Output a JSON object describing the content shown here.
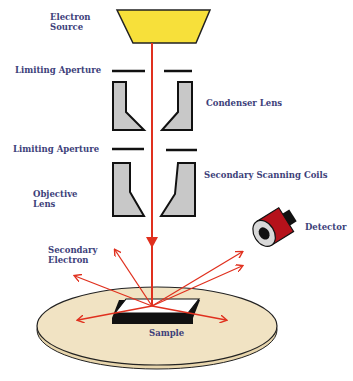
{
  "labels": {
    "electron_source_line1": "Electron",
    "electron_source_line2": "Source",
    "limiting_aperture_top": "Limiting Aperture",
    "condenser_lens": "Condenser Lens",
    "limiting_aperture_bottom": "Limiting Aperture",
    "secondary_scanning_coils": "Secondary Scanning Coils",
    "objective_lens_line1": "Objective",
    "objective_lens_line2": "Lens",
    "secondary_electron_line1": "Secondary",
    "secondary_electron_line2": "Electron",
    "detector": "Detector",
    "sample": "Sample"
  },
  "colors": {
    "label_text": "#3d3f7a",
    "electron_source": "#f7e03a",
    "beam": "#e0301e",
    "lens": "#c8c8c8",
    "stage": "#f1e3c3",
    "detector_body": "#b5121b",
    "outline": "#111111"
  }
}
